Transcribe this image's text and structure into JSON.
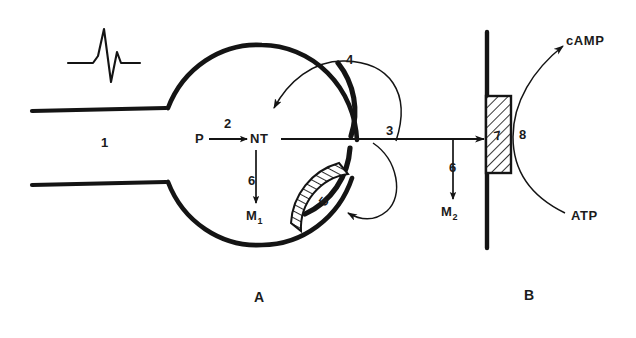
{
  "figure": {
    "panels": [
      {
        "id": "A",
        "label": "A",
        "description": "presynaptic neuron terminal"
      },
      {
        "id": "B",
        "label": "B",
        "description": "postsynaptic membrane"
      }
    ],
    "ink_color": "#141414",
    "background": "#ffffff"
  },
  "labels": {
    "step1": "1",
    "step2": "2",
    "step3": "3",
    "step4": "4",
    "step5": "5",
    "step6_presynaptic": "6",
    "step6_cleft": "6",
    "step7": "7",
    "step8": "8",
    "precursor": "P",
    "neurotransmitter": "NT",
    "metabolite1_base": "M",
    "metabolite1_sub": "1",
    "metabolite2_base": "M",
    "metabolite2_sub": "2",
    "camp": "cAMP",
    "atp": "ATP",
    "panel_a": "A",
    "panel_b": "B"
  },
  "elements": {
    "action_potential_icon": "spike-waveform",
    "axon": "axon-shaft",
    "terminal_bouton": "presynaptic-terminal-circle",
    "autoreceptor": "hatched-autoreceptor-arc",
    "postsynaptic_receptor": "hatched-receptor-box",
    "postsynaptic_membrane": "vertical-membrane-line",
    "reuptake_arrow": "curved-reuptake-arrow",
    "feedback_arrow": "curved-feedback-arrow",
    "release_arrow": "horizontal-release-arrow",
    "cyclase_arc": "adenylate-cyclase-arc"
  }
}
